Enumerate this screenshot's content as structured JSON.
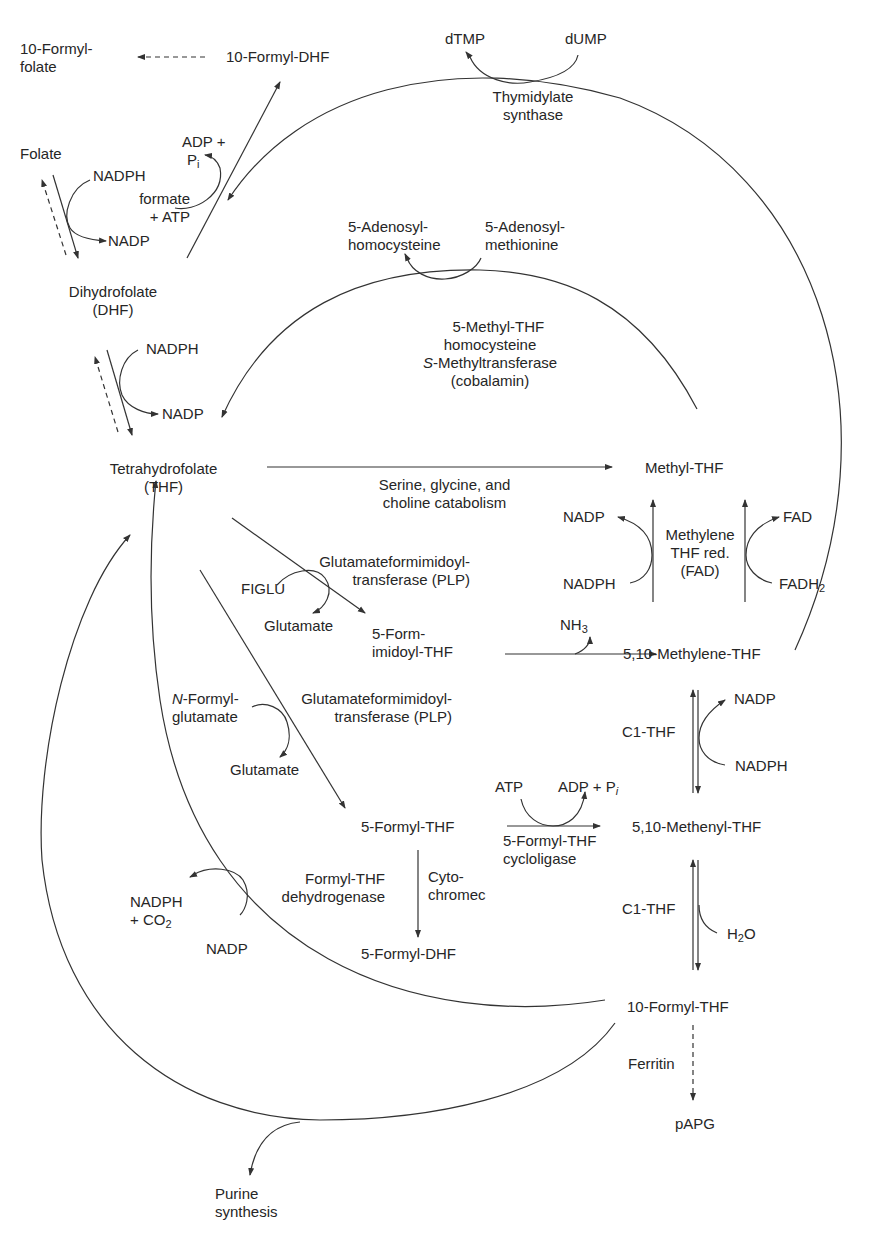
{
  "diagram": {
    "compounds": {
      "formyl_folate": "10-Formyl-\nfolate",
      "formyl_dhf_10": "10-Formyl-DHF",
      "folate": "Folate",
      "dhf": "Dihydrofolate\n(DHF)",
      "thf": "Tetrahydrofolate\n(THF)",
      "dtmp": "dTMP",
      "dump": "dUMP",
      "sah": "5-Adenosyl-\nhomocysteine",
      "sam": "5-Adenosyl-\nmethionine",
      "methyl_thf": "Methyl-THF",
      "methylene_thf": "5,10-Methylene-THF",
      "formimidoyl_thf": "5-Form-\nimidoyl-THF",
      "formyl_thf_5": "5-Formyl-THF",
      "methenyl_thf": "5,10-Methenyl-THF",
      "formyl_dhf_5": "5-Formyl-DHF",
      "formyl_thf_10": "10-Formyl-THF",
      "papg": "pAPG",
      "purine": "Purine\nsynthesis"
    },
    "cofactors": {
      "adp_pi_top_line1": "ADP +",
      "adp_pi_top_line2": "P",
      "adp_pi_top_sub": "i",
      "formate_atp": "formate\n+ ATP",
      "nadph_folate": "NADPH",
      "nadp_folate": "NADP",
      "nadph_dhf": "NADPH",
      "nadp_dhf": "NADP",
      "nadp_mtr": "NADP",
      "nadph_mtr": "NADPH",
      "fad": "FAD",
      "fadh2": "FADH",
      "fadh2_sub": "2",
      "nh3": "NH",
      "nh3_sub": "3",
      "figlu": "FIGLU",
      "glutamate_1": "Glutamate",
      "n_formyl_italic": "N",
      "n_formyl_rest": "-Formyl-\nglutamate",
      "glutamate_2": "Glutamate",
      "nadp_c1": "NADP",
      "nadph_c1": "NADPH",
      "atp": "ATP",
      "adp_pi": "ADP + P",
      "adp_pi_sub": "i",
      "h2o_h": "H",
      "h2o_sub": "2",
      "h2o_o": "O",
      "nadph_co2_line1": "NADPH",
      "nadph_co2_line2": "+ CO",
      "co2_sub": "2",
      "nadp_fdh": "NADP"
    },
    "enzymes": {
      "thymidylate_synthase": "Thymidylate\nsynthase",
      "methionine_synthase_1": "5-Methyl-THF\nhomocysteine",
      "methionine_synthase_s": "S",
      "methionine_synthase_2": "-Methyltransferase",
      "methionine_synthase_3": "(cobalamin)",
      "serine_glycine": "Serine, glycine, and\ncholine catabolism",
      "mthfr": "Methylene\nTHF red.\n(FAD)",
      "glu_formimidoyl_1": "Glutamateformimidoyl-\ntransferase (PLP)",
      "glu_formimidoyl_2": "Glutamateformimidoyl-\ntransferase (PLP)",
      "c1_thf_1": "C1-THF",
      "c1_thf_2": "C1-THF",
      "cycloligase": "5-Formyl-THF\ncycloligase",
      "cytochrome": "Cyto-\nchromec",
      "fdh": "Formyl-THF\ndehydrogenase",
      "ferritin": "Ferritin"
    },
    "colors": {
      "ink": "#262626",
      "line": "#333333",
      "background": "#ffffff"
    }
  }
}
